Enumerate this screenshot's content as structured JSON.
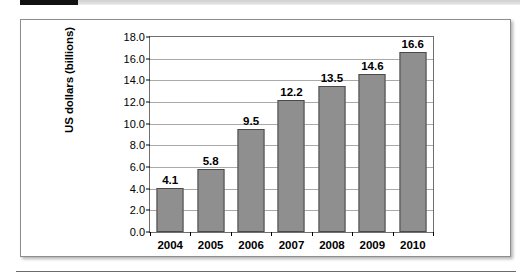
{
  "header": {
    "tab_black_label": "",
    "tab_gray_label": ""
  },
  "chart_data": {
    "type": "bar",
    "title": "",
    "xlabel": "",
    "ylabel": "US dollars (billions)",
    "categories": [
      "2004",
      "2005",
      "2006",
      "2007",
      "2008",
      "2009",
      "2010"
    ],
    "values": [
      4.1,
      5.8,
      9.5,
      12.2,
      13.5,
      14.6,
      16.6
    ],
    "value_labels": [
      "4.1",
      "5.8",
      "9.5",
      "12.2",
      "13.5",
      "14.6",
      "16.6"
    ],
    "ylim": [
      0.0,
      18.0
    ],
    "ytick_step": 2.0,
    "ytick_labels": [
      "18.0",
      "16.0",
      "14.0",
      "12.0",
      "10.0",
      "8.0",
      "6.0",
      "4.0",
      "2.0",
      "0.0"
    ],
    "ytick_values": [
      18.0,
      16.0,
      14.0,
      12.0,
      10.0,
      8.0,
      6.0,
      4.0,
      2.0,
      0.0
    ],
    "grid": true,
    "legend": false,
    "bar_color": "#8f8f8f",
    "bar_border_color": "#4a4a4a",
    "gridline_color": "#a9a9a9",
    "axis_color": "#6f6f6f",
    "plot_background": "#ffffff"
  },
  "colors": {
    "header_accent": "#111111",
    "header_strip": "#dedede",
    "frame_border": "#8d8d8d",
    "rule": "#6b6b6b"
  }
}
